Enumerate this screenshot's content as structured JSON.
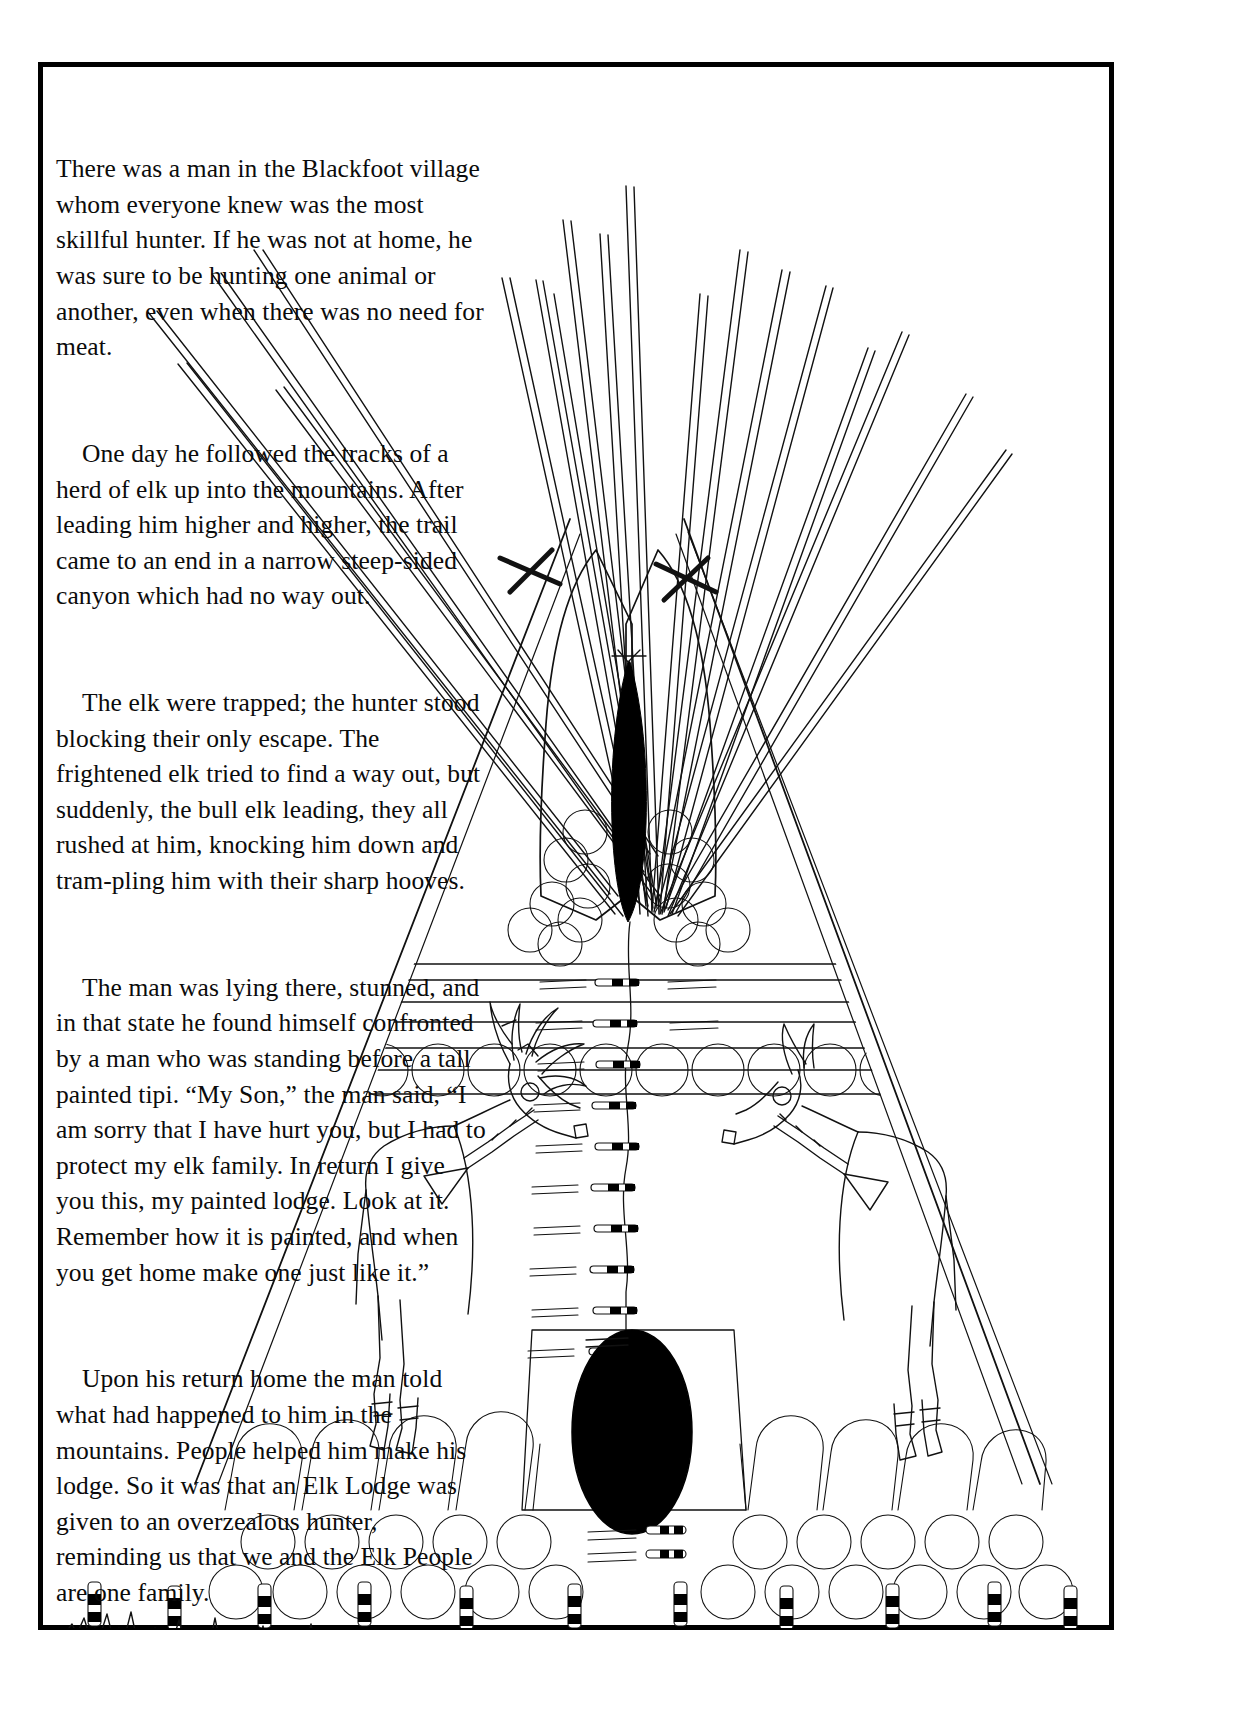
{
  "page": {
    "background_color": "#ffffff",
    "ink_color": "#000000",
    "border_color": "#000000"
  },
  "story": {
    "paragraphs": [
      "There was a man in the Blackfoot village whom everyone knew was the most skillful hunter. If he was not at home, he was sure to be hunting one animal or another, even when there was no need for meat.",
      "One day he followed the tracks of a herd of elk up into the mountains. After leading him higher and higher, the trail came to an end in a narrow steep-sided canyon which had no way out.",
      "The elk were trapped; the hunter stood blocking their only escape. The frightened elk tried to find a way out, but suddenly, the bull elk leading, they all rushed at him, knocking him down and tram-pling him with their sharp hooves.",
      "The man was lying there, stunned, and in that state he found himself confronted by a man who was standing before a tall painted tipi. “My Son,” the man said, “I am sorry that I have hurt you, but I had to protect my elk family. In return I give you this, my painted lodge. Look at it. Remember how it is painted, and when you get home make one just like it.”",
      "Upon his return home the man told what had happened to him in the mountains. People helped him make his lodge. So it was that an Elk Lodge was given to an overzealous hunter, reminding us that we and the Elk People are one family."
    ],
    "line_breaks": [
      "There was a man in the Blackfoot village",
      "whom everyone knew was the most skillful",
      "hunter. If he was not at home, he was sure to",
      "be hunting one animal or another, even when",
      "there was no need for meat.",
      "One day he followed the tracks of a herd",
      "of elk up into the mountains. After leading",
      "him higher and higher, the trail came to",
      "an end in a narrow steep-sided canyon",
      "which had no way out.",
      "The elk were trapped; the hunter",
      "stood blocking their only escape. The",
      "frightened elk tried to find a way out, but",
      "suddenly, the bull elk leading, they all",
      "rushed at him, knocking him down and tram-",
      "pling him with their sharp hooves.",
      "The man was lying there, stunned, and in",
      "that state he found himself confronted by a",
      "man who was standing before a tall painted",
      "tipi. “My Son,” the man said, “I am sorry",
      "that I have hurt you, but I had to protect",
      "my elk family. In return I give you this,",
      "my painted lodge. Look at it. Remember",
      "how it is painted, and when you get",
      "home make one just like it.”",
      "Upon his return home the man",
      "told what had happened to him in",
      "the mountains. People helped him",
      "make his lodge. So it was that an",
      "Elk Lodge was given to an",
      "overzealous hunter, reminding",
      "us that we and the Elk People",
      "are one family."
    ]
  },
  "illustration": {
    "subject": "Blackfoot painted Elk Lodge tipi",
    "elements": {
      "lodge_poles_label": "tipi lodge poles",
      "smoke_flaps_label": "smoke flaps",
      "smoke_hole_label": "smoke hole",
      "bull_elk_label": "bull elk with antlers",
      "cow_elk_label": "cow elk",
      "door_label": "door flap with oval doorway",
      "lacing_pins_label": "lacing pins",
      "bottom_band_label": "bottom band of arches and circles",
      "ground_line_label": "prairie ground line",
      "stakes_label": "ground stakes"
    },
    "counts": {
      "lodge_poles": 17,
      "smoke_flap_circles_left": 7,
      "smoke_flap_circles_right": 7,
      "band_circles_row": 14,
      "bottom_arches": 14,
      "bottom_circles_upper": 14,
      "bottom_circles_lower": 13,
      "lacing_pins": 14,
      "ground_stakes": 12,
      "horizontal_band_lines": 6
    }
  }
}
